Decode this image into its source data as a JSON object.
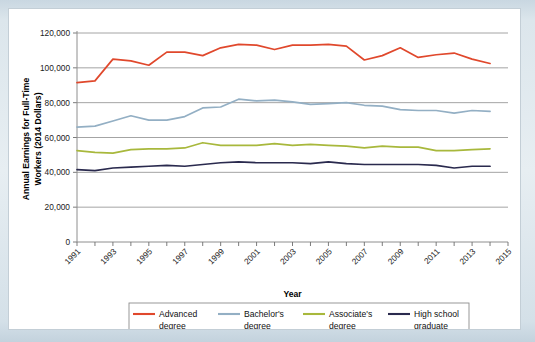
{
  "chart_data": {
    "type": "line",
    "title": "",
    "xlabel": "Year",
    "ylabel": "Annual Earnings for Full-Time Workers (2014 Dollars)",
    "ylabel_line1": "Annual Earnings for Full-Time",
    "ylabel_line2": "Workers (2014 Dollars)",
    "xlim": [
      1991,
      2015
    ],
    "ylim": [
      0,
      120000
    ],
    "grid": true,
    "legend_position": "bottom",
    "y_ticks": [
      0,
      20000,
      40000,
      60000,
      80000,
      100000,
      120000
    ],
    "y_tick_labels": [
      "0",
      "20,000",
      "40,000",
      "60,000",
      "80,000",
      "100,000",
      "120,000"
    ],
    "x_ticks": [
      1991,
      1992,
      1993,
      1994,
      1995,
      1996,
      1997,
      1998,
      1999,
      2000,
      2001,
      2002,
      2003,
      2004,
      2005,
      2006,
      2007,
      2008,
      2009,
      2010,
      2011,
      2012,
      2013,
      2014,
      2015
    ],
    "x_tick_labels": [
      "1991",
      "1993",
      "1995",
      "1997",
      "1999",
      "2001",
      "2003",
      "2005",
      "2007",
      "2009",
      "2011",
      "2013",
      "2015"
    ],
    "x_labeled_ticks": [
      1991,
      1993,
      1995,
      1997,
      1999,
      2001,
      2003,
      2005,
      2007,
      2009,
      2011,
      2013,
      2015
    ],
    "x": [
      1991,
      1992,
      1993,
      1994,
      1995,
      1996,
      1997,
      1998,
      1999,
      2000,
      2001,
      2002,
      2003,
      2004,
      2005,
      2006,
      2007,
      2008,
      2009,
      2010,
      2011,
      2012,
      2013,
      2014
    ],
    "series": [
      {
        "name": "Advanced degree",
        "label_line1": "Advanced",
        "label_line2": "degree",
        "color": "#E0482C",
        "values": [
          91500,
          92500,
          105000,
          104000,
          101500,
          109000,
          109000,
          107000,
          111500,
          113500,
          113000,
          110500,
          113000,
          113000,
          113500,
          112500,
          104500,
          107000,
          111500,
          106000,
          107500,
          108500,
          105000,
          102500
        ]
      },
      {
        "name": "Bachelor's degree",
        "label_line1": "Bachelor's",
        "label_line2": "degree",
        "color": "#93AFC4",
        "values": [
          66000,
          66500,
          69500,
          72500,
          70000,
          70000,
          72000,
          77000,
          77500,
          82000,
          81000,
          81500,
          80500,
          79000,
          79500,
          80000,
          78500,
          78000,
          76000,
          75500,
          75500,
          74000,
          75500,
          75000
        ]
      },
      {
        "name": "Associate's degree",
        "label_line1": "Associate's",
        "label_line2": "degree",
        "color": "#A8B83C",
        "values": [
          52500,
          51500,
          51000,
          53000,
          53500,
          53500,
          54000,
          57000,
          55500,
          55500,
          55500,
          56500,
          55500,
          56000,
          55500,
          55000,
          54000,
          55000,
          54500,
          54500,
          52500,
          52500,
          53000,
          53500
        ]
      },
      {
        "name": "High school graduate",
        "label_line1": "High school",
        "label_line2": "graduate",
        "color": "#2A2A4E",
        "values": [
          41500,
          41000,
          42500,
          43000,
          43500,
          44000,
          43500,
          44500,
          45500,
          46000,
          45500,
          45500,
          45500,
          45000,
          46000,
          45000,
          44500,
          44500,
          44500,
          44500,
          44000,
          42500,
          43500,
          43500
        ]
      }
    ]
  }
}
